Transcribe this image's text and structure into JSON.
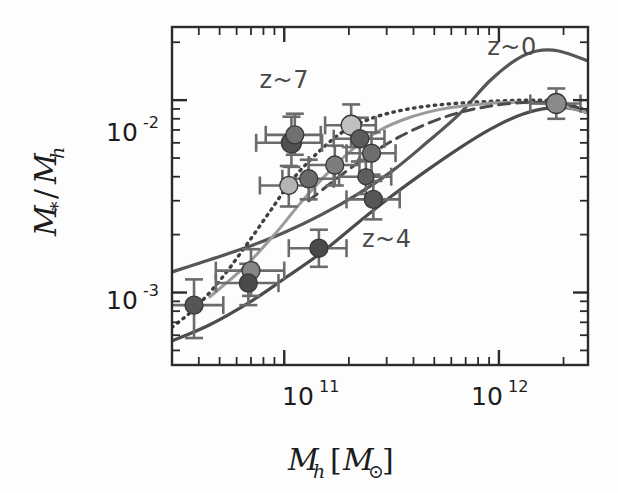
{
  "figure": {
    "background": "#fdfdfd",
    "plot_frame_color": "#2b2b2b"
  },
  "axes": {
    "x_label_main": "M",
    "x_label_sub": "h",
    "x_label_bracket_open": "[",
    "x_label_unit": "M",
    "x_label_unit_sub": "⊙",
    "x_label_bracket_close": "]",
    "x_label_full": "M_h [M_⊙]",
    "y_label_num": "M",
    "y_label_num_sub": "*",
    "y_label_slash": "/",
    "y_label_den": "M",
    "y_label_den_sub": "h",
    "y_label_full": "M_*/M_h",
    "x_ticks": [
      {
        "value": 100000000000.0,
        "mantissa": "10",
        "exponent": "11"
      },
      {
        "value": 1000000000000.0,
        "mantissa": "10",
        "exponent": "12"
      }
    ],
    "y_ticks": [
      {
        "value": 0.01,
        "mantissa": "10",
        "exponent": "-2"
      },
      {
        "value": 0.001,
        "mantissa": "10",
        "exponent": "-3"
      }
    ],
    "xlim": [
      30000000000.0,
      2600000000000.0
    ],
    "ylim": [
      0.00042,
      0.024
    ],
    "xscale": "log",
    "yscale": "log",
    "grid": false
  },
  "annotations": [
    {
      "text": "z~0",
      "x": 1150000000000.0,
      "y": 0.0172,
      "color": "#5a5a5a"
    },
    {
      "text": "z~7",
      "x": 100000000000.0,
      "y": 0.0116,
      "color": "#5a5a5a"
    },
    {
      "text": "z~4",
      "x": 300000000000.0,
      "y": 0.00172,
      "color": "#5a5a5a"
    }
  ],
  "chart_data": {
    "type": "scatter",
    "title": "",
    "xlabel": "M_h [M_⊙]",
    "ylabel": "M_*/M_h",
    "xscale": "log",
    "yscale": "log",
    "xlim": [
      30000000000.0,
      2600000000000.0
    ],
    "ylim": [
      0.00042,
      0.024
    ],
    "grid": false,
    "legend": "inline-annotations",
    "series": [
      {
        "name": "z~0 model",
        "style": "solid",
        "color": "#565656",
        "width": 3.2,
        "points": [
          [
            30000000000.0,
            0.00128
          ],
          [
            45000000000.0,
            0.00148
          ],
          [
            70000000000.0,
            0.00175
          ],
          [
            100000000000.0,
            0.00205
          ],
          [
            150000000000.0,
            0.00255
          ],
          [
            220000000000.0,
            0.00325
          ],
          [
            320000000000.0,
            0.0043
          ],
          [
            460000000000.0,
            0.006
          ],
          [
            650000000000.0,
            0.0084
          ],
          [
            900000000000.0,
            0.0125
          ],
          [
            1200000000000.0,
            0.0162
          ],
          [
            1500000000000.0,
            0.018
          ],
          [
            1900000000000.0,
            0.018
          ],
          [
            2600000000000.0,
            0.016
          ]
        ]
      },
      {
        "name": "z~4 model",
        "style": "solid",
        "color": "#4c4c4c",
        "width": 3.2,
        "points": [
          [
            30000000000.0,
            0.00056
          ],
          [
            45000000000.0,
            0.00068
          ],
          [
            70000000000.0,
            0.0009
          ],
          [
            100000000000.0,
            0.00118
          ],
          [
            150000000000.0,
            0.00162
          ],
          [
            220000000000.0,
            0.0023
          ],
          [
            320000000000.0,
            0.0032
          ],
          [
            460000000000.0,
            0.0043
          ],
          [
            650000000000.0,
            0.0056
          ],
          [
            900000000000.0,
            0.007
          ],
          [
            1200000000000.0,
            0.0082
          ],
          [
            1600000000000.0,
            0.009
          ],
          [
            2100000000000.0,
            0.0091
          ],
          [
            2600000000000.0,
            0.0086
          ]
        ]
      },
      {
        "name": "z~7 model",
        "style": "dotted",
        "color": "#3f3f3f",
        "width": 3.4,
        "points": [
          [
            30000000000.0,
            0.00066
          ],
          [
            38000000000.0,
            0.00082
          ],
          [
            50000000000.0,
            0.00115
          ],
          [
            65000000000.0,
            0.0017
          ],
          [
            85000000000.0,
            0.0026
          ],
          [
            110000000000.0,
            0.0039
          ],
          [
            145000000000.0,
            0.0054
          ],
          [
            190000000000.0,
            0.0069
          ],
          [
            260000000000.0,
            0.0081
          ],
          [
            360000000000.0,
            0.0089
          ],
          [
            500000000000.0,
            0.0094
          ],
          [
            700000000000.0,
            0.0097
          ],
          [
            1000000000000.0,
            0.0099
          ],
          [
            1400000000000.0,
            0.01
          ],
          [
            1900000000000.0,
            0.0098
          ],
          [
            2600000000000.0,
            0.0088
          ]
        ]
      },
      {
        "name": "intermediate model (light)",
        "style": "solid",
        "color": "#9a9a9a",
        "width": 3.0,
        "points": [
          [
            45000000000.0,
            0.00095
          ],
          [
            65000000000.0,
            0.00135
          ],
          [
            90000000000.0,
            0.002
          ],
          [
            120000000000.0,
            0.00295
          ],
          [
            160000000000.0,
            0.0042
          ],
          [
            210000000000.0,
            0.0056
          ],
          [
            280000000000.0,
            0.007
          ],
          [
            380000000000.0,
            0.0081
          ],
          [
            520000000000.0,
            0.0089
          ],
          [
            720000000000.0,
            0.0094
          ],
          [
            1000000000000.0,
            0.0097
          ],
          [
            1400000000000.0,
            0.0097
          ],
          [
            1900000000000.0,
            0.0094
          ],
          [
            2600000000000.0,
            0.0086
          ]
        ]
      },
      {
        "name": "dashed model",
        "style": "dashed",
        "color": "#4a4a4a",
        "width": 3.0,
        "points": [
          [
            130000000000.0,
            0.003
          ],
          [
            180000000000.0,
            0.004
          ],
          [
            250000000000.0,
            0.0052
          ],
          [
            340000000000.0,
            0.0064
          ],
          [
            470000000000.0,
            0.0076
          ],
          [
            650000000000.0,
            0.0086
          ],
          [
            900000000000.0,
            0.0093
          ],
          [
            1250000000000.0,
            0.0097
          ],
          [
            1700000000000.0,
            0.0097
          ],
          [
            2200000000000.0,
            0.0093
          ],
          [
            2600000000000.0,
            0.0088
          ]
        ]
      }
    ],
    "points": [
      {
        "set": "z~4",
        "x": 38000000000.0,
        "y": 0.00086,
        "xerr_lo": 11000000000.0,
        "xerr_hi": 14000000000.0,
        "yerr_lo": 0.00028,
        "yerr_hi": 0.00031,
        "color": "#555555",
        "r": 9
      },
      {
        "set": "z~4",
        "x": 70000000000.0,
        "y": 0.0013,
        "xerr_lo": 22000000000.0,
        "xerr_hi": 30000000000.0,
        "yerr_lo": 0.00034,
        "yerr_hi": 0.00038,
        "color": "#858585",
        "r": 9
      },
      {
        "set": "z~4",
        "x": 68000000000.0,
        "y": 0.00112,
        "xerr_lo": 20000000000.0,
        "xerr_hi": 26000000000.0,
        "yerr_lo": 0.00026,
        "yerr_hi": 0.00029,
        "color": "#4a4a4a",
        "r": 9
      },
      {
        "set": "z~4",
        "x": 145000000000.0,
        "y": 0.0017,
        "xerr_lo": 40000000000.0,
        "xerr_hi": 50000000000.0,
        "yerr_lo": 0.00034,
        "yerr_hi": 0.00042,
        "color": "#4a4a4a",
        "r": 9
      },
      {
        "set": "z~4",
        "x": 260000000000.0,
        "y": 0.00305,
        "xerr_lo": 65000000000.0,
        "xerr_hi": 85000000000.0,
        "yerr_lo": 0.00065,
        "yerr_hi": 0.00075,
        "color": "#565656",
        "r": 9
      },
      {
        "set": "z~4",
        "x": 240000000000.0,
        "y": 0.004,
        "xerr_lo": 60000000000.0,
        "xerr_hi": 75000000000.0,
        "yerr_lo": 0.00075,
        "yerr_hi": 0.0009,
        "color": "#5e5e5e",
        "r": 8
      },
      {
        "set": "z~7",
        "x": 108000000000.0,
        "y": 0.006,
        "xerr_lo": 34000000000.0,
        "xerr_hi": 42000000000.0,
        "yerr_lo": 0.0015,
        "yerr_hi": 0.0022,
        "color": "#505050",
        "r": 10
      },
      {
        "set": "z~7",
        "x": 112000000000.0,
        "y": 0.0066,
        "xerr_lo": 30000000000.0,
        "xerr_hi": 36000000000.0,
        "yerr_lo": 0.0014,
        "yerr_hi": 0.0019,
        "color": "#707070",
        "r": 9
      },
      {
        "set": "z~7",
        "x": 105000000000.0,
        "y": 0.0036,
        "xerr_lo": 28000000000.0,
        "xerr_hi": 34000000000.0,
        "yerr_lo": 0.0008,
        "yerr_hi": 0.00095,
        "color": "#b4b4b4",
        "r": 9
      },
      {
        "set": "z~7",
        "x": 130000000000.0,
        "y": 0.0039,
        "xerr_lo": 32000000000.0,
        "xerr_hi": 40000000000.0,
        "yerr_lo": 0.00085,
        "yerr_hi": 0.001,
        "color": "#6a6a6a",
        "r": 9
      },
      {
        "set": "z~7",
        "x": 172000000000.0,
        "y": 0.0046,
        "xerr_lo": 42000000000.0,
        "xerr_hi": 52000000000.0,
        "yerr_lo": 0.001,
        "yerr_hi": 0.0012,
        "color": "#7d7d7d",
        "r": 9
      },
      {
        "set": "z~7",
        "x": 205000000000.0,
        "y": 0.0074,
        "xerr_lo": 50000000000.0,
        "xerr_hi": 62000000000.0,
        "yerr_lo": 0.0017,
        "yerr_hi": 0.0021,
        "color": "#c0c0c0",
        "r": 10
      },
      {
        "set": "z~7",
        "x": 225000000000.0,
        "y": 0.0063,
        "xerr_lo": 55000000000.0,
        "xerr_hi": 68000000000.0,
        "yerr_lo": 0.0015,
        "yerr_hi": 0.0018,
        "color": "#5c5c5c",
        "r": 9
      },
      {
        "set": "z~7",
        "x": 255000000000.0,
        "y": 0.0053,
        "xerr_lo": 60000000000.0,
        "xerr_hi": 75000000000.0,
        "yerr_lo": 0.0012,
        "yerr_hi": 0.0015,
        "color": "#6e6e6e",
        "r": 9
      },
      {
        "set": "z~0",
        "x": 1850000000000.0,
        "y": 0.0096,
        "xerr_lo": 450000000000.0,
        "xerr_hi": 550000000000.0,
        "yerr_lo": 0.0016,
        "yerr_hi": 0.0019,
        "color": "#8a8a8a",
        "r": 10
      }
    ]
  }
}
